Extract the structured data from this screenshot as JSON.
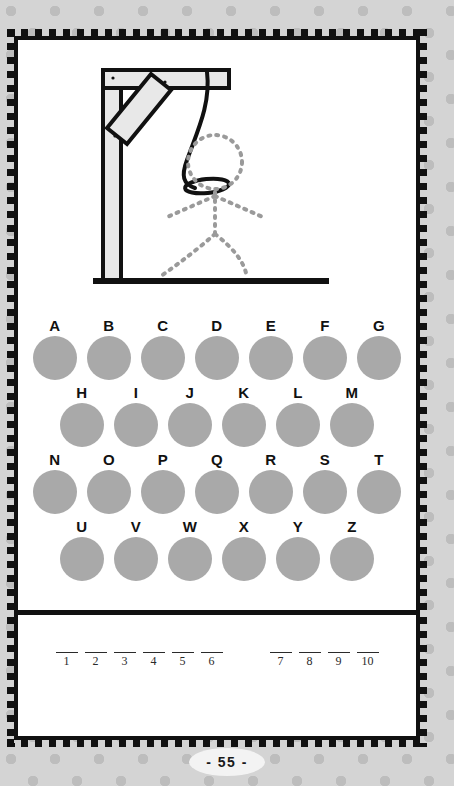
{
  "page": {
    "page_number_label": "- 55 -",
    "background_color": "#d4d4d4",
    "dot_color": "#bdbdbd",
    "card_color": "#ffffff",
    "frame_color": "#111111"
  },
  "illustration": {
    "name": "hangman-gallows",
    "description": "Gallows with hanging rope and dotted stick figure",
    "post_fill": "#e8e8e8",
    "outline_color": "#111111",
    "figure_color": "#9a9a9a",
    "rope_color": "#111111"
  },
  "alphabet": {
    "circle_color": "#a9a9a9",
    "rows": [
      {
        "letters": [
          "A",
          "B",
          "C",
          "D",
          "E",
          "F",
          "G"
        ]
      },
      {
        "letters": [
          "H",
          "I",
          "J",
          "K",
          "L",
          "M"
        ]
      },
      {
        "letters": [
          "N",
          "O",
          "P",
          "Q",
          "R",
          "S",
          "T"
        ]
      },
      {
        "letters": [
          "U",
          "V",
          "W",
          "X",
          "Y",
          "Z"
        ]
      }
    ]
  },
  "answer_blanks": {
    "word_one": [
      "1",
      "2",
      "3",
      "4",
      "5",
      "6"
    ],
    "word_two": [
      "7",
      "8",
      "9",
      "10"
    ]
  }
}
